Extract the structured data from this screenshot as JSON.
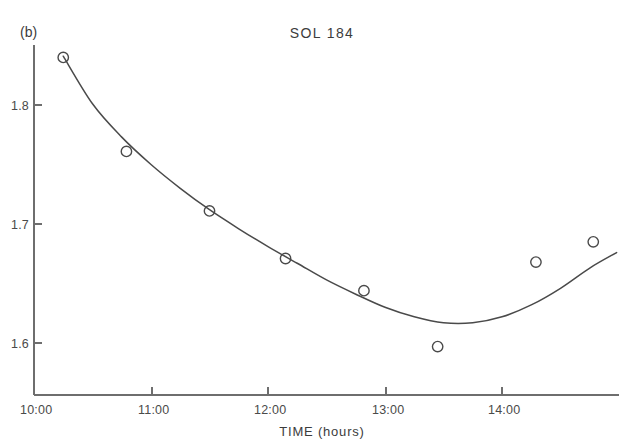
{
  "figure": {
    "panel_label": "(b)",
    "title": "SOL 184",
    "background_color": "#ffffff",
    "ink_color": "#4a4a4a"
  },
  "chart_data": {
    "type": "scatter",
    "title": "SOL 184",
    "subtitle": "",
    "panel": "(b)",
    "xlabel": "TIME (hours)",
    "ylabel": "",
    "xlim": [
      10.0,
      15.0
    ],
    "ylim": [
      1.545,
      1.855
    ],
    "grid": false,
    "legend": null,
    "x_tick_labels": [
      "10:00",
      "11:00",
      "12:00",
      "13:00",
      "14:00"
    ],
    "x_tick_values": [
      10.0,
      11.0,
      12.0,
      13.0,
      14.0
    ],
    "y_tick_labels": [
      "1.8",
      "1.7",
      "1.6"
    ],
    "y_tick_values": [
      1.8,
      1.7,
      1.6
    ],
    "marker_style": "open-circle",
    "points": [
      {
        "x": 10.25,
        "y": 1.84,
        "x_label": "10:15"
      },
      {
        "x": 10.79,
        "y": 1.761,
        "x_label": "10:47"
      },
      {
        "x": 11.5,
        "y": 1.711,
        "x_label": "11:30"
      },
      {
        "x": 12.15,
        "y": 1.671,
        "x_label": "12:09"
      },
      {
        "x": 12.82,
        "y": 1.644,
        "x_label": "12:49"
      },
      {
        "x": 13.45,
        "y": 1.597,
        "x_label": "13:27"
      },
      {
        "x": 14.29,
        "y": 1.668,
        "x_label": "14:17"
      },
      {
        "x": 14.78,
        "y": 1.685,
        "x_label": "14:47"
      }
    ],
    "series": [
      {
        "name": "observed",
        "values": [
          1.84,
          1.761,
          1.711,
          1.671,
          1.644,
          1.597,
          1.668,
          1.685
        ]
      },
      {
        "name": "fitted-curve",
        "x": [
          10.25,
          10.5,
          10.75,
          11.0,
          11.25,
          11.5,
          11.75,
          12.0,
          12.25,
          12.5,
          12.75,
          13.0,
          13.25,
          13.5,
          13.75,
          14.0,
          14.25,
          14.5,
          14.75,
          14.98
        ],
        "values": [
          1.841,
          1.801,
          1.773,
          1.75,
          1.73,
          1.712,
          1.696,
          1.681,
          1.667,
          1.653,
          1.641,
          1.63,
          1.622,
          1.617,
          1.617,
          1.622,
          1.632,
          1.646,
          1.663,
          1.676
        ]
      }
    ]
  }
}
